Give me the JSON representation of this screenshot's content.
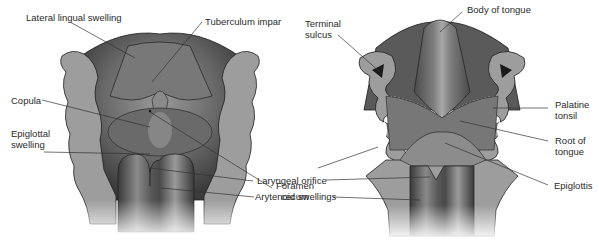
{
  "figure": {
    "colors": {
      "background": "#ffffff",
      "section_gray": "#9d9d9d",
      "tissue_dark": "#3c3c3c",
      "tissue_mid": "#6e6e6e",
      "tissue_light": "#b4b4b4",
      "outline": "#1e1e1e",
      "label_text": "#2a2a2a",
      "leader_line": "#333333"
    },
    "left_panel": {
      "labels": {
        "lateral_lingual_swelling": "Lateral lingual swelling",
        "tuberculum_impar": "Tuberculum impar",
        "copula": "Copula",
        "epiglottal_swelling_line1": "Epiglottal",
        "epiglottal_swelling_line2": "swelling"
      }
    },
    "center_labels": {
      "foramen_cecum_line1": "Foramen",
      "foramen_cecum_line2": "cecum",
      "laryngeal_orifice": "Laryngeal orifice",
      "arytenoid_swellings": "Arytenoid swellings"
    },
    "right_panel": {
      "labels": {
        "terminal_sulcus_line1": "Terminal",
        "terminal_sulcus_line2": "sulcus",
        "body_of_tongue": "Body of tongue",
        "palatine_tonsil_line1": "Palatine",
        "palatine_tonsil_line2": "tonsil",
        "root_of_tongue_line1": "Root of",
        "root_of_tongue_line2": "tongue",
        "epiglottis": "Epiglottis"
      }
    }
  }
}
